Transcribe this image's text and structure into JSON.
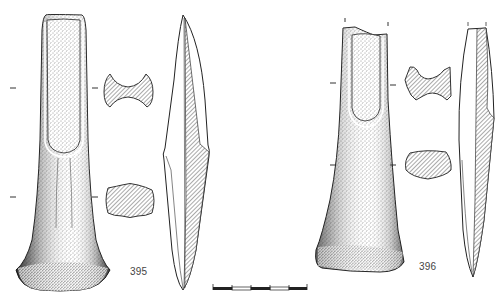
{
  "figure": {
    "type": "archaeological-plate",
    "background": "#ffffff",
    "ink_color": "#222222",
    "hatch_color": "#555555"
  },
  "objects": [
    {
      "id": "395",
      "label": "395",
      "views": [
        "front-view",
        "cross-section-upper",
        "cross-section-lower",
        "side-profile"
      ],
      "section_marks": 2
    },
    {
      "id": "396",
      "label": "396",
      "views": [
        "front-view",
        "cross-section-upper",
        "cross-section-lower",
        "side-profile"
      ],
      "section_marks": 2
    }
  ],
  "scale_bar": {
    "segments": 5,
    "pattern": [
      "black",
      "white",
      "black",
      "white",
      "black"
    ]
  }
}
